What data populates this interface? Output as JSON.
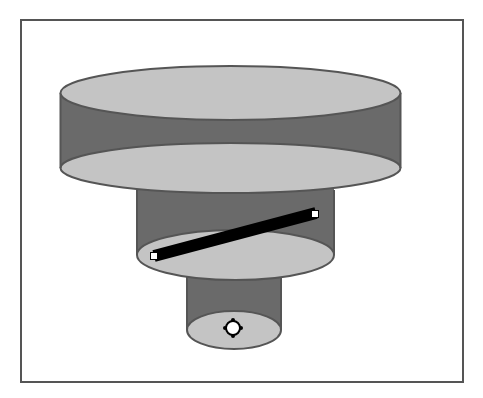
{
  "diagram": {
    "colors": {
      "background": "#ffffff",
      "frame": "#555555",
      "cylinder_side": "#6a6a6a",
      "cylinder_face": "#c4c4c4",
      "outline": "#555555",
      "bar": "#000000",
      "handle_fill": "#ffffff"
    },
    "frame": {
      "x": 21,
      "y": 20,
      "w": 442,
      "h": 362
    },
    "cylinders": [
      {
        "name": "top-cylinder",
        "cx": 230.5,
        "top_cy": 93,
        "bottom_cy": 168,
        "rx": 170,
        "ry": 27
      },
      {
        "name": "middle-cylinder",
        "cx": 235.5,
        "top_cy": 168,
        "bottom_cy": 255,
        "rx": 98.5,
        "ry": 25
      },
      {
        "name": "bottom-cylinder",
        "cx": 234,
        "top_cy": 255,
        "bottom_cy": 330,
        "rx": 47,
        "ry": 19
      }
    ],
    "bar": {
      "x1": 154,
      "y1": 256,
      "x2": 316,
      "y2": 213,
      "thickness": 12
    },
    "bar_handles": [
      {
        "name": "bar-handle-left",
        "x": 154,
        "y": 256,
        "size": 7
      },
      {
        "name": "bar-handle-right",
        "x": 315,
        "y": 214,
        "size": 7
      }
    ],
    "center_handle": {
      "x": 233,
      "y": 328,
      "r": 7
    }
  }
}
